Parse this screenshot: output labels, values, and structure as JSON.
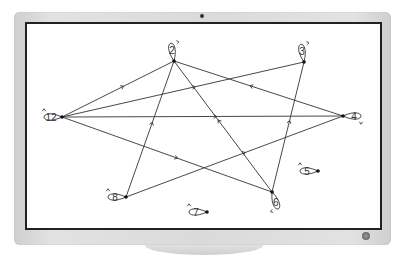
{
  "device": {
    "type": "monitor",
    "bezel_color": "#dadada",
    "screen_border_color": "#222222"
  },
  "graph": {
    "title": "",
    "directed": true,
    "nodes": [
      {
        "id": "2",
        "label": "2",
        "x": 174,
        "y": 61
      },
      {
        "id": "3",
        "label": "3",
        "x": 304,
        "y": 62
      },
      {
        "id": "4",
        "label": "4",
        "x": 343,
        "y": 116
      },
      {
        "id": "5",
        "label": "5",
        "x": 318,
        "y": 171
      },
      {
        "id": "6",
        "label": "6",
        "x": 272,
        "y": 192
      },
      {
        "id": "7",
        "label": "7",
        "x": 207,
        "y": 212
      },
      {
        "id": "8",
        "label": "8",
        "x": 126,
        "y": 197
      },
      {
        "id": "12",
        "label": "12",
        "x": 62,
        "y": 117
      }
    ],
    "edges": [
      {
        "from": "12",
        "to": "2"
      },
      {
        "from": "12",
        "to": "3"
      },
      {
        "from": "12",
        "to": "4"
      },
      {
        "from": "12",
        "to": "6"
      },
      {
        "from": "8",
        "to": "2"
      },
      {
        "from": "8",
        "to": "4"
      },
      {
        "from": "6",
        "to": "2"
      },
      {
        "from": "6",
        "to": "3"
      },
      {
        "from": "4",
        "to": "2"
      }
    ],
    "self_loops": [
      "2",
      "3",
      "4",
      "5",
      "6",
      "7",
      "8",
      "12"
    ]
  }
}
